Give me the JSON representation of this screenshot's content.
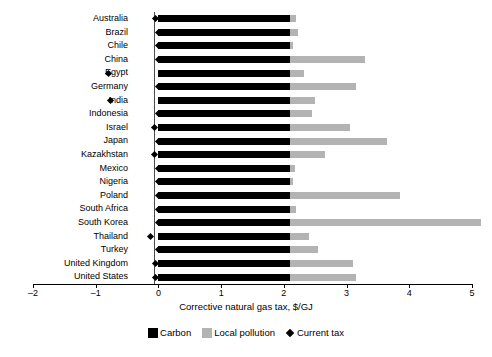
{
  "chart_data": {
    "type": "bar",
    "orientation": "horizontal",
    "stacked": true,
    "title": "",
    "xlabel": "Corrective natural gas tax, $/GJ",
    "ylabel": "",
    "xlim": [
      -2,
      5
    ],
    "xticks": [
      -2,
      -1,
      0,
      1,
      2,
      3,
      4,
      5
    ],
    "xtick_labels": [
      "–2",
      "–1",
      "0",
      "1",
      "2",
      "3",
      "4",
      "5"
    ],
    "grid": false,
    "legend_position": "bottom",
    "categories": [
      "Australia",
      "Brazil",
      "Chile",
      "China",
      "Egypt",
      "Germany",
      "India",
      "Indonesia",
      "Israel",
      "Japan",
      "Kazakhstan",
      "Mexico",
      "Nigeria",
      "Poland",
      "South Africa",
      "South Korea",
      "Thailand",
      "Turkey",
      "United Kingdom",
      "United States"
    ],
    "series": [
      {
        "name": "Carbon",
        "color": "#000000",
        "values": [
          2.1,
          2.1,
          2.1,
          2.1,
          2.1,
          2.1,
          2.1,
          2.1,
          2.1,
          2.1,
          2.1,
          2.1,
          2.1,
          2.1,
          2.1,
          2.1,
          2.1,
          2.1,
          2.1,
          2.1
        ]
      },
      {
        "name": "Local pollution",
        "color": "#b3b3b3",
        "values": [
          0.1,
          0.12,
          0.05,
          1.2,
          0.22,
          1.05,
          0.4,
          0.35,
          0.95,
          1.55,
          0.55,
          0.08,
          0.04,
          1.75,
          0.1,
          3.05,
          0.3,
          0.45,
          1.0,
          1.05
        ]
      }
    ],
    "markers": {
      "name": "Current tax",
      "color": "#000000",
      "shape": "diamond",
      "values": [
        -0.04,
        0.0,
        0.0,
        0.0,
        -0.8,
        0.0,
        -0.77,
        0.0,
        -0.06,
        0.0,
        -0.06,
        0.0,
        0.0,
        0.0,
        0.0,
        0.0,
        -0.12,
        0.0,
        -0.05,
        -0.05
      ]
    },
    "legend": [
      {
        "label": "Carbon",
        "color": "#000000",
        "marker": "square"
      },
      {
        "label": "Local pollution",
        "color": "#b3b3b3",
        "marker": "square"
      },
      {
        "label": "Current tax",
        "color": "#000000",
        "marker": "diamond"
      }
    ]
  }
}
